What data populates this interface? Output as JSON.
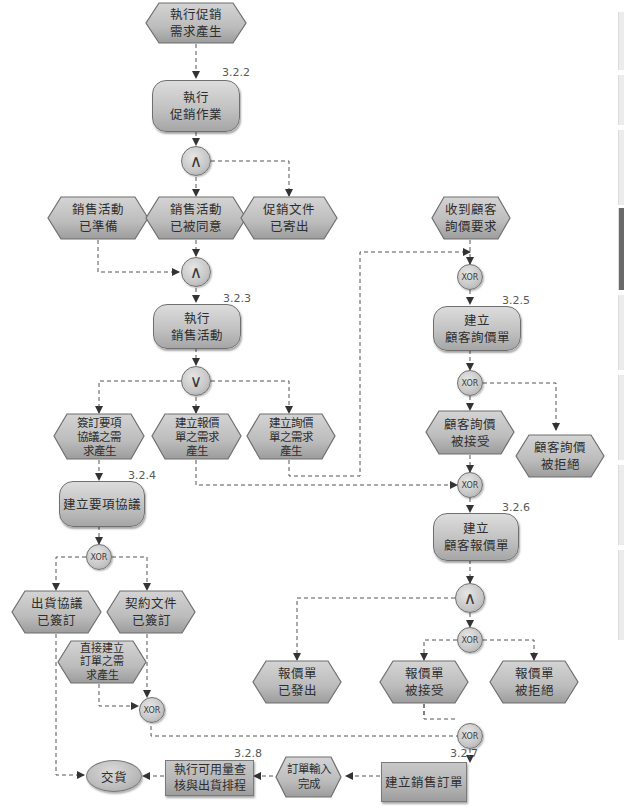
{
  "diagram": {
    "type": "EPC process chain",
    "colors": {
      "node_fill": "#bdbdbd",
      "node_border": "#6f6f6f",
      "line": "#555555",
      "text": "#2e2e2e"
    },
    "events": {
      "promo_need": "執行促銷\n需求產生",
      "sales_ready": "銷售活動\n已準備",
      "sales_approved": "銷售活動\n已被同意",
      "promo_docs_sent": "促銷文件\n已寄出",
      "sign_terms_need": "簽訂要項\n協議之需\n求產生",
      "quote_need": "建立報價\n單之需求\n產生",
      "inquiry_need": "建立詢價\n單之需求\n產生",
      "ship_agreement_signed": "出貨協議\n已簽訂",
      "contract_signed": "契約文件\n已簽訂",
      "direct_order_need": "直接建立\n訂單之需\n求產生",
      "customer_inquiry_received": "收到顧客\n詢價要求",
      "inquiry_accepted": "顧客詢價\n被接受",
      "inquiry_rejected": "顧客詢價\n被拒絕",
      "quote_sent": "報價單\n已發出",
      "quote_accepted": "報價單\n被接受",
      "quote_rejected": "報價單\n被拒絕",
      "order_entry_done": "訂單輸入\n完成"
    },
    "functions": {
      "f322": {
        "label": "執行\n促銷作業",
        "num": "3.2.2"
      },
      "f323": {
        "label": "執行\n銷售活動",
        "num": "3.2.3"
      },
      "f324": {
        "label": "建立要項協議",
        "num": "3.2.4"
      },
      "f325": {
        "label": "建立\n顧客詢價單",
        "num": "3.2.5"
      },
      "f326": {
        "label": "建立\n顧客報價單",
        "num": "3.2.6"
      },
      "f327": {
        "label": "建立銷售訂單",
        "num": "3.2.7"
      },
      "f328": {
        "label": "執行可用量查\n核與出貨排程",
        "num": "3.2.8"
      }
    },
    "gateways": {
      "and_symbol": "∧",
      "or_symbol": "∨",
      "xor_label": "XOR"
    },
    "terminal": {
      "delivery": "交貨"
    }
  }
}
